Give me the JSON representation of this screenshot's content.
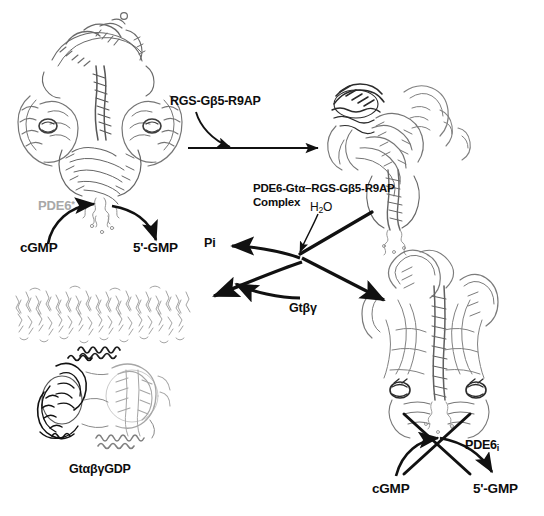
{
  "figure": {
    "background_color": "#ffffff",
    "ink_color": "#111111",
    "gray_label_color": "#a8a8a8"
  },
  "labels": {
    "pde6_active": "PDE6",
    "pde6_active_sup": "*",
    "rgs_complex": "RGS-Gβ5-R9AP",
    "pde6_gta_complex_line1": "PDE6-Gtα–RGS-Gβ5-R9AP",
    "pde6_gta_complex_line2": "Complex",
    "water": "H",
    "water_sub": "2",
    "water_tail": "O",
    "pi": "Pi",
    "gt_betagamma": "Gtβγ",
    "gt_alphabetagamma_gdp": "GtαβγGDP",
    "pde6_inactive": "PDE6",
    "pde6_inactive_sub": "i",
    "cgmp_left": "cGMP",
    "gmp_left": "5'-GMP",
    "cgmp_right": "cGMP",
    "gmp_right": "5'-GMP"
  },
  "panels": [
    {
      "id": "pde6-active-structure",
      "name": "PDE6 activated holoenzyme ribbon structure",
      "position": "top-left",
      "label": "PDE6*"
    },
    {
      "id": "pde6-gta-rgs-complex-structure",
      "name": "PDE6-Gt-alpha-RGS-Gbeta5-R9AP complex ribbon structure",
      "position": "top-right",
      "label": "PDE6-Gtα–RGS-Gβ5-R9AP Complex"
    },
    {
      "id": "gt-heterotrimer-membrane-structure",
      "name": "Gt alpha-beta-gamma GDP heterotrimer on lipid membrane",
      "position": "bottom-left",
      "label": "GtαβγGDP"
    },
    {
      "id": "pde6-inactive-structure",
      "name": "PDE6 inactive holoenzyme ribbon structure",
      "position": "bottom-right",
      "label": "PDE6i"
    }
  ],
  "reactions": [
    {
      "id": "catalysis-active",
      "name": "cGMP to 5'-GMP hydrolysis by active PDE6",
      "substrate": "cGMP",
      "product": "5'-GMP",
      "blocked": false
    },
    {
      "id": "rgs-binding",
      "name": "RGS-Gbeta5-R9AP binding step",
      "reagent": "RGS-Gβ5-R9AP",
      "blocked": false
    },
    {
      "id": "gtp-hydrolysis",
      "name": "GTP hydrolysis releasing Pi and Gt-beta-gamma",
      "reagent": "H2O",
      "products": [
        "Pi",
        "Gtβγ",
        "GtαβγGDP",
        "PDE6i"
      ],
      "blocked": false
    },
    {
      "id": "catalysis-inactive",
      "name": "cGMP to 5'-GMP hydrolysis blocked at inactive PDE6",
      "substrate": "cGMP",
      "product": "5'-GMP",
      "blocked": true
    }
  ]
}
